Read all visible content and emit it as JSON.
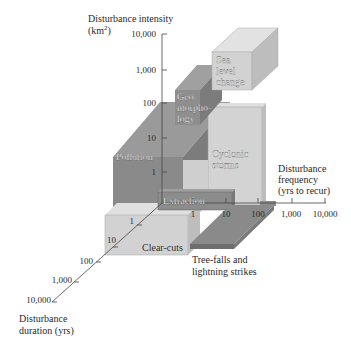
{
  "axes": {
    "y": {
      "title_line1": "Disturbance intensity",
      "title_line2": "(km",
      "title_sup": "2",
      "title_close": ")",
      "ticks": [
        "10,000",
        "1,000",
        "100",
        "10",
        "1"
      ]
    },
    "x": {
      "title_line1": "Disturbance",
      "title_line2": "frequency",
      "title_line3": "(yrs to recur)",
      "ticks": [
        "1",
        "10",
        "100",
        "1,000",
        "10,000"
      ]
    },
    "z": {
      "title_line1": "Disturbance",
      "title_line2": "duration (yrs)",
      "ticks": [
        "1",
        "10",
        "100",
        "1,000",
        "10,000"
      ]
    }
  },
  "boxes": {
    "sea_level": {
      "line1": "Sea",
      "line2": "level",
      "line3": "change"
    },
    "geomorphology": {
      "line1": "Geo-",
      "line2": "morpho-",
      "line3": "logy"
    },
    "pollution": {
      "label": "Pollution"
    },
    "cyclonic": {
      "line1": "Cyclonic",
      "line2": "storms"
    },
    "extraction": {
      "label": "Extraction"
    },
    "clearcuts": {
      "label": "Clear-cuts"
    },
    "treefalls": {
      "line1": "Tree-falls and",
      "line2": "lightning strikes"
    }
  },
  "colors": {
    "light": "#d2d2d2",
    "light_side": "#bdbdbd",
    "light_top": "#e2e2e2",
    "dark": "#8c8c8c",
    "dark_side": "#7a7a7a",
    "dark_top": "#a0a0a0",
    "axis": "#444444"
  }
}
